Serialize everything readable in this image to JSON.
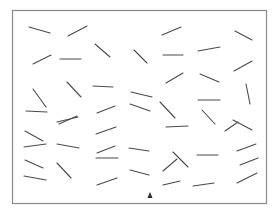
{
  "stimulus": {
    "type": "visual-search-line-segments",
    "segment_color": "#4a4a4a",
    "frame_color": "#8a8a8a",
    "background": "#ffffff",
    "segment_count": 44,
    "cursor_icon": "arrow-up-icon"
  }
}
